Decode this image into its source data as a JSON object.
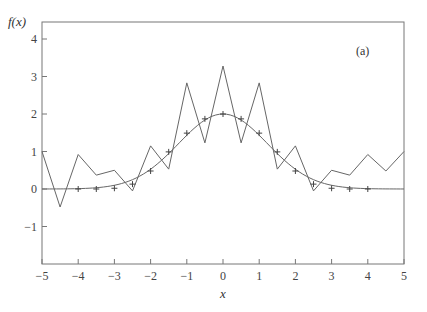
{
  "chart_data": {
    "type": "line",
    "title": "",
    "annotation": "(a)",
    "xlabel": "x",
    "ylabel": "f(x)",
    "xlim": [
      -5,
      5
    ],
    "ylim": [
      -2,
      4.45
    ],
    "grid": false,
    "legend": null,
    "x_ticks": [
      -5,
      -4,
      -3,
      -2,
      -1,
      0,
      1,
      2,
      3,
      4,
      5
    ],
    "y_ticks": [
      -1,
      0,
      1,
      2,
      3,
      4
    ],
    "series": [
      {
        "name": "interpolant (oscillating)",
        "style": "thin line",
        "x": [
          -5,
          -4.5,
          -4,
          -3.5,
          -3,
          -2.5,
          -2,
          -1.5,
          -1,
          -0.5,
          0,
          0.5,
          1,
          1.5,
          2,
          2.5,
          3,
          3.5,
          4,
          4.5,
          5
        ],
        "values": [
          1.0,
          -0.48,
          0.92,
          0.37,
          0.5,
          -0.05,
          1.15,
          0.53,
          2.83,
          1.23,
          3.28,
          1.23,
          2.83,
          0.53,
          1.15,
          -0.05,
          0.5,
          0.37,
          0.92,
          0.48,
          1.0
        ]
      },
      {
        "name": "smooth function",
        "style": "thin curve",
        "x": [
          -5,
          -4.5,
          -4,
          -3.5,
          -3,
          -2.5,
          -2,
          -1.5,
          -1,
          -0.5,
          0,
          0.5,
          1,
          1.5,
          2,
          2.5,
          3,
          3.5,
          4,
          4.5,
          5
        ],
        "values": [
          0.0,
          0.0,
          0.0,
          0.0,
          0.02,
          0.13,
          0.48,
          0.99,
          1.49,
          1.87,
          2.0,
          1.87,
          1.49,
          0.99,
          0.48,
          0.13,
          0.02,
          0.0,
          0.0,
          0.0,
          0.0
        ]
      },
      {
        "name": "data points",
        "style": "plus markers",
        "x": [
          -4,
          -3.5,
          -3,
          -2.5,
          -2,
          -1.5,
          -1,
          -0.5,
          0,
          0.5,
          1,
          1.5,
          2,
          2.5,
          3,
          3.5,
          4
        ],
        "values": [
          0.0,
          0.0,
          0.02,
          0.13,
          0.48,
          0.99,
          1.49,
          1.87,
          2.0,
          1.87,
          1.49,
          0.99,
          0.48,
          0.13,
          0.02,
          0.0,
          0.0
        ]
      }
    ]
  },
  "labels": {
    "ylabel": "f(x)",
    "xlabel": "x",
    "annotation": "(a)"
  }
}
